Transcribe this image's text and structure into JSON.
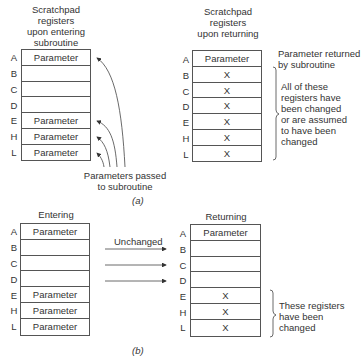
{
  "part_a": {
    "caption": "(a)",
    "left": {
      "title_lines": [
        "Scratchpad",
        "registers",
        "upon entering",
        "subroutine"
      ],
      "registers": [
        {
          "name": "A",
          "value": "Parameter"
        },
        {
          "name": "B",
          "value": ""
        },
        {
          "name": "C",
          "value": ""
        },
        {
          "name": "D",
          "value": ""
        },
        {
          "name": "E",
          "value": "Parameter"
        },
        {
          "name": "H",
          "value": "Parameter"
        },
        {
          "name": "L",
          "value": "Parameter"
        }
      ],
      "arrow_note_lines": [
        "Parameters passed",
        "to subroutine"
      ]
    },
    "right": {
      "title_lines": [
        "Scratchpad",
        "registers",
        "upon returning"
      ],
      "registers": [
        {
          "name": "A",
          "value": "Parameter"
        },
        {
          "name": "B",
          "value": "X"
        },
        {
          "name": "C",
          "value": "X"
        },
        {
          "name": "D",
          "value": "X"
        },
        {
          "name": "E",
          "value": "X"
        },
        {
          "name": "H",
          "value": "X"
        },
        {
          "name": "L",
          "value": "X"
        }
      ],
      "note_returned_lines": [
        "Parameter returned",
        "by subroutine"
      ],
      "note_changed_lines": [
        "All of these",
        "registers have",
        "been changed",
        "or are assumed",
        "to have been",
        "changed"
      ]
    }
  },
  "part_b": {
    "caption": "(b)",
    "left": {
      "title": "Entering",
      "registers": [
        {
          "name": "A",
          "value": "Parameter"
        },
        {
          "name": "B",
          "value": ""
        },
        {
          "name": "C",
          "value": ""
        },
        {
          "name": "D",
          "value": ""
        },
        {
          "name": "E",
          "value": "Parameter"
        },
        {
          "name": "H",
          "value": "Parameter"
        },
        {
          "name": "L",
          "value": "Parameter"
        }
      ]
    },
    "arrow_label": "Unchanged",
    "right": {
      "title": "Returning",
      "registers": [
        {
          "name": "A",
          "value": "Parameter"
        },
        {
          "name": "B",
          "value": ""
        },
        {
          "name": "C",
          "value": ""
        },
        {
          "name": "D",
          "value": ""
        },
        {
          "name": "E",
          "value": "X"
        },
        {
          "name": "H",
          "value": "X"
        },
        {
          "name": "L",
          "value": "X"
        }
      ],
      "note_lines": [
        "These registers",
        "have been",
        "changed"
      ]
    }
  }
}
